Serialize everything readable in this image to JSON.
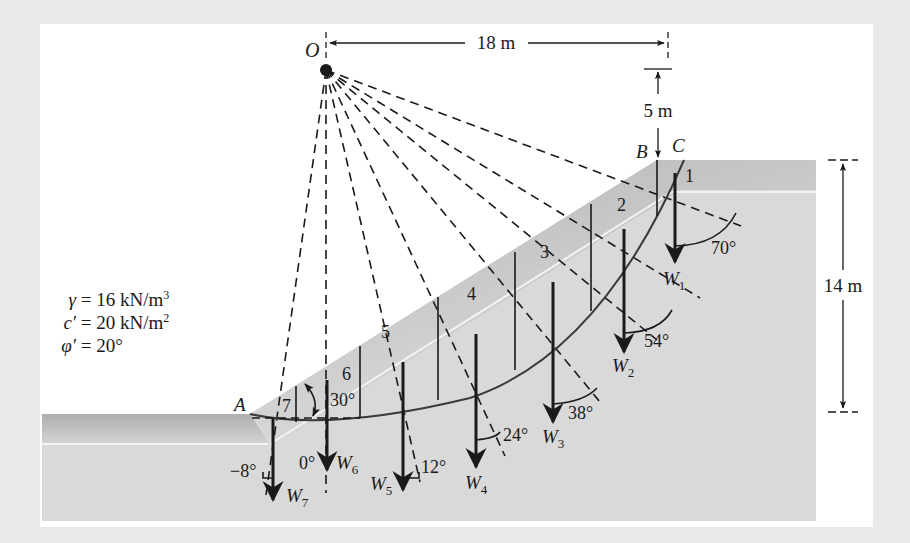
{
  "figure": {
    "points": {
      "O": "O",
      "A": "A",
      "B": "B",
      "C": "C"
    },
    "dimensions": {
      "horizontal_O_to_crest": "18 m",
      "vertical_O_above_crest": "5 m",
      "slope_height": "14 m"
    },
    "slope_angle": "30°",
    "soil_parameters": [
      {
        "symbol": "γ",
        "equals": "=",
        "value": "16 kN/m",
        "exponent": "3"
      },
      {
        "symbol": "c′",
        "equals": "=",
        "value": "20 kN/m",
        "exponent": "2"
      },
      {
        "symbol": "φ′",
        "equals": "=",
        "value": "20°",
        "exponent": ""
      }
    ],
    "slices": [
      {
        "number": "1",
        "weight": "W",
        "sub": "1",
        "angle": "70°"
      },
      {
        "number": "2",
        "weight": "W",
        "sub": "2",
        "angle": "54°"
      },
      {
        "number": "3",
        "weight": "W",
        "sub": "3",
        "angle": "38°"
      },
      {
        "number": "4",
        "weight": "W",
        "sub": "4",
        "angle": "24°"
      },
      {
        "number": "5",
        "weight": "W",
        "sub": "5",
        "angle": "12°"
      },
      {
        "number": "6",
        "weight": "W",
        "sub": "6",
        "angle": "0°"
      },
      {
        "number": "7",
        "weight": "W",
        "sub": "7",
        "angle": "−8°"
      }
    ],
    "colors": {
      "frame": "#e9e9e9",
      "panel": "#ffffff",
      "soil": "#d9d9d9",
      "soil_surface": "#bdbdbd",
      "ink": "#1a1a1a"
    }
  }
}
